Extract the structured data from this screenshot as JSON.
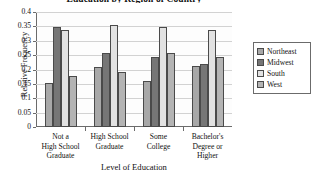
{
  "chart_data": {
    "type": "bar",
    "title": "Education by Region of Country",
    "xlabel": "Level of Education",
    "ylabel": "Relative Frequency",
    "categories": [
      "Not a High School Graduate",
      "High School Graduate",
      "Some College",
      "Bachelor's Degree or Higher"
    ],
    "category_lines": [
      [
        "Not a",
        "High School",
        "Graduate"
      ],
      [
        "High School",
        "Graduate"
      ],
      [
        "Some",
        "College"
      ],
      [
        "Bachelor's",
        "Degree or",
        "Higher"
      ]
    ],
    "series": [
      {
        "name": "Northeast",
        "color": "#a8a8a8",
        "values": [
          0.152,
          0.209,
          0.161,
          0.213
        ]
      },
      {
        "name": "Midwest",
        "color": "#767676",
        "values": [
          0.348,
          0.256,
          0.243,
          0.219
        ]
      },
      {
        "name": "South",
        "color": "#e2e2e2",
        "values": [
          0.337,
          0.355,
          0.349,
          0.336
        ]
      },
      {
        "name": "West",
        "color": "#b4b4b4",
        "values": [
          0.176,
          0.19,
          0.258,
          0.245
        ]
      }
    ],
    "ylim": [
      0,
      0.4
    ],
    "yticks": [
      0,
      0.05,
      0.1,
      0.15,
      0.2,
      0.25,
      0.3,
      0.35,
      0.4
    ],
    "ytick_labels": [
      "0",
      "0.05",
      "0.1",
      "0.15",
      "0.2",
      "0.25",
      "0.3",
      "0.35",
      "0.4"
    ],
    "grid": true,
    "legend_position": "right"
  },
  "legend": {
    "items": [
      {
        "label": "Northeast"
      },
      {
        "label": "Midwest"
      },
      {
        "label": "South"
      },
      {
        "label": "West"
      }
    ]
  }
}
